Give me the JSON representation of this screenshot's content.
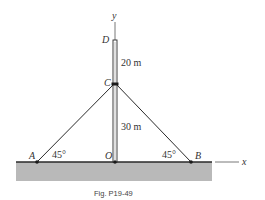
{
  "figure": {
    "caption": "Fig. P19-49",
    "axes": {
      "x_label": "x",
      "y_label": "y"
    },
    "points": {
      "A": "A",
      "B": "B",
      "C": "C",
      "D": "D",
      "O": "O"
    },
    "dimensions": {
      "upper_segment": "20 m",
      "lower_segment": "30 m"
    },
    "angles": {
      "left": "45°",
      "right": "45°"
    },
    "colors": {
      "ground": "#b9b9b9",
      "line": "#2a2a2a",
      "pole": "#ffffff"
    }
  }
}
